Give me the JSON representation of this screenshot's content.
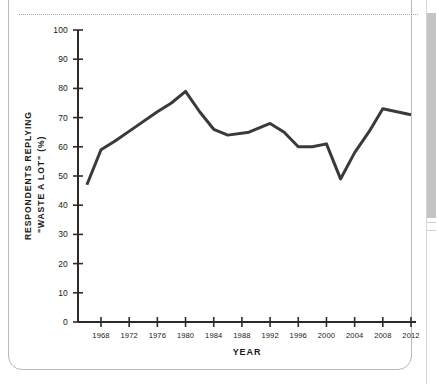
{
  "figure": {
    "background_color": "#ffffff",
    "frame_color": "#b9b9b9",
    "separator_style": "dotted"
  },
  "scrollbar": {
    "name": "vertical-scrollbar",
    "thumb_color": "#c4c4c4",
    "track_color": "#ffffff"
  },
  "chart_data": {
    "type": "line",
    "title": "",
    "subtitle": "",
    "xlabel": "YEAR",
    "ylabel_line1": "RESPONDENTS REPLYING",
    "ylabel_line2": "\"WASTE A LOT\" (%)",
    "ylabel": "RESPONDENTS REPLYING \"WASTE A LOT\" (%)",
    "series_name": "Respondents replying \"waste a lot\"",
    "line_color": "#3a3a3a",
    "line_width": 3,
    "grid": false,
    "legend": "none",
    "xlim": [
      1965,
      2013
    ],
    "ylim": [
      0,
      100
    ],
    "ytick_labels": [
      "100",
      "90",
      "80",
      "70",
      "60",
      "50",
      "40",
      "30",
      "20",
      "10",
      "0"
    ],
    "yticks": [
      100,
      90,
      80,
      70,
      60,
      50,
      40,
      30,
      20,
      10,
      0
    ],
    "xtick_labels": [
      "1968",
      "1972",
      "1976",
      "1980",
      "1984",
      "1988",
      "1992",
      "1996",
      "2000",
      "2004",
      "2008",
      "2012"
    ],
    "xticks": [
      1968,
      1972,
      1976,
      1980,
      1984,
      1988,
      1992,
      1996,
      2000,
      2004,
      2008,
      2012
    ],
    "x": [
      1966,
      1968,
      1970,
      1973,
      1976,
      1978,
      1980,
      1982,
      1984,
      1986,
      1989,
      1992,
      1994,
      1996,
      1998,
      2000,
      2002,
      2004,
      2006,
      2008,
      2010,
      2012
    ],
    "values": [
      47,
      59,
      62,
      67,
      72,
      75,
      79,
      72,
      66,
      64,
      65,
      68,
      65,
      60,
      60,
      61,
      49,
      58,
      65,
      73,
      72,
      71
    ],
    "points": [
      {
        "year": 1966,
        "value": 47
      },
      {
        "year": 1968,
        "value": 59
      },
      {
        "year": 1970,
        "value": 62
      },
      {
        "year": 1973,
        "value": 67
      },
      {
        "year": 1976,
        "value": 72
      },
      {
        "year": 1978,
        "value": 75
      },
      {
        "year": 1980,
        "value": 79
      },
      {
        "year": 1982,
        "value": 72
      },
      {
        "year": 1984,
        "value": 66
      },
      {
        "year": 1986,
        "value": 64
      },
      {
        "year": 1989,
        "value": 65
      },
      {
        "year": 1992,
        "value": 68
      },
      {
        "year": 1994,
        "value": 65
      },
      {
        "year": 1996,
        "value": 60
      },
      {
        "year": 1998,
        "value": 60
      },
      {
        "year": 2000,
        "value": 61
      },
      {
        "year": 2002,
        "value": 49
      },
      {
        "year": 2004,
        "value": 58
      },
      {
        "year": 2006,
        "value": 65
      },
      {
        "year": 2008,
        "value": 73
      },
      {
        "year": 2010,
        "value": 72
      },
      {
        "year": 2012,
        "value": 71
      }
    ]
  }
}
